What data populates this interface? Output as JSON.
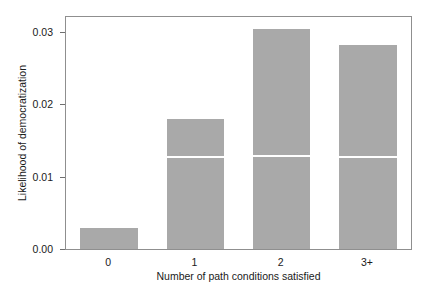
{
  "chart_data": {
    "type": "bar",
    "title": "",
    "xlabel": "Number of path conditions satisfied",
    "ylabel": "Likelihood of democratization",
    "categories": [
      "0",
      "1",
      "2",
      "3+"
    ],
    "values": [
      0.0029,
      0.018,
      0.0303,
      0.0282
    ],
    "ylim": [
      0.0,
      0.032
    ],
    "yticks": [
      0.0,
      0.01,
      0.02,
      0.03
    ],
    "ytick_labels": [
      "0.00",
      "0.01",
      "0.02",
      "0.03"
    ],
    "xtick_labels": [
      "0",
      "1",
      "2",
      "3+"
    ],
    "grid": false,
    "legend": null,
    "bar_color": "#a9a9a9",
    "frame_color": "#8f8f8f",
    "reference_lines": {
      "color": "#ffffff",
      "label": "",
      "values": [
        null,
        0.0125,
        0.0127,
        0.0125
      ]
    },
    "annotations": []
  }
}
